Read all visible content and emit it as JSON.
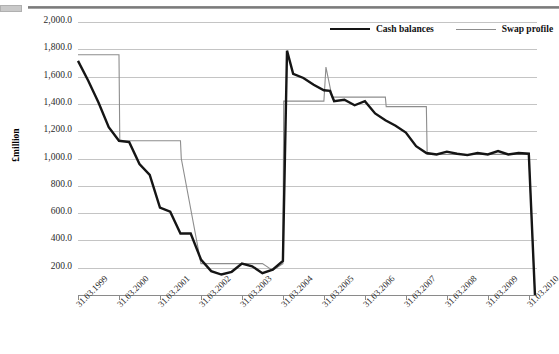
{
  "chart_data": {
    "type": "line",
    "title": "",
    "xlabel": "",
    "ylabel": "£million",
    "ylim": [
      0,
      2000
    ],
    "ytick_values": [
      2000,
      1800,
      1600,
      1400,
      1200,
      1000,
      800,
      600,
      400,
      200
    ],
    "ytick_labels": [
      "2,000.0",
      "1,800.0",
      "1,600.0",
      "1,400.0",
      "1,200.0",
      "1,000.0",
      "800.0",
      "600.0",
      "400.0",
      "200.0"
    ],
    "grid": true,
    "legend_position": "top-right",
    "x_tick_labels": [
      "31.03.1999",
      "31.03.2000",
      "31.03.2001",
      "31.03.2002",
      "31.03.2003",
      "31.03.2004",
      "31.03.2005",
      "31.03.2006",
      "31.03.2007",
      "31.03.2008",
      "31.03.2009",
      "31.03.2010"
    ],
    "x_tick_positions_years": [
      0,
      1,
      2,
      3,
      4,
      5,
      6,
      7,
      8,
      9,
      10,
      11
    ],
    "x_range_years": [
      0,
      11.2
    ],
    "series": [
      {
        "name": "Cash balances",
        "color": "#151515",
        "width": 2.4,
        "x": [
          0.0,
          0.25,
          0.5,
          0.75,
          1.0,
          1.25,
          1.5,
          1.75,
          2.0,
          2.25,
          2.5,
          2.75,
          3.0,
          3.25,
          3.5,
          3.75,
          4.0,
          4.25,
          4.5,
          4.75,
          5.0,
          5.1,
          5.25,
          5.5,
          5.75,
          6.0,
          6.15,
          6.25,
          6.5,
          6.75,
          7.0,
          7.25,
          7.5,
          7.75,
          8.0,
          8.25,
          8.5,
          8.75,
          9.0,
          9.25,
          9.5,
          9.75,
          10.0,
          10.25,
          10.5,
          10.75,
          11.0,
          11.15
        ],
        "values": [
          1715,
          1570,
          1410,
          1230,
          1130,
          1120,
          960,
          880,
          640,
          610,
          450,
          450,
          260,
          175,
          150,
          170,
          230,
          210,
          160,
          185,
          250,
          1790,
          1620,
          1590,
          1540,
          1500,
          1495,
          1420,
          1430,
          1390,
          1420,
          1330,
          1280,
          1240,
          1190,
          1090,
          1040,
          1030,
          1050,
          1035,
          1025,
          1040,
          1030,
          1055,
          1030,
          1040,
          1035,
          0
        ]
      },
      {
        "name": "Swap profile",
        "color": "#8d8d8d",
        "width": 1.1,
        "x": [
          0.0,
          0.5,
          1.0,
          1.02,
          1.5,
          2.0,
          2.5,
          2.52,
          3.0,
          3.5,
          4.0,
          4.5,
          4.75,
          5.0,
          5.02,
          5.5,
          6.0,
          6.05,
          6.2,
          6.25,
          6.5,
          7.0,
          7.5,
          7.52,
          8.0,
          8.5,
          8.52,
          9.0,
          9.5,
          10.0,
          10.5,
          11.0,
          11.15
        ],
        "values": [
          1760,
          1760,
          1760,
          1130,
          1130,
          1130,
          1130,
          1000,
          230,
          230,
          230,
          230,
          180,
          230,
          1420,
          1420,
          1420,
          1670,
          1450,
          1450,
          1450,
          1450,
          1450,
          1380,
          1380,
          1380,
          1030,
          1030,
          1030,
          1030,
          1030,
          1030,
          0
        ]
      }
    ]
  }
}
